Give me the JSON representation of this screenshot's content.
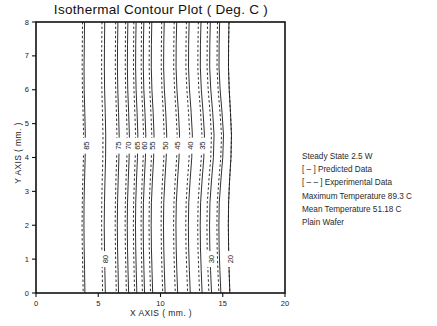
{
  "chart_data": {
    "type": "line",
    "title": "Isothermal Contour Plot  ( Deg. C )",
    "xlabel": "X AXIS ( mm. )",
    "ylabel": "Y AXIS ( mm. )",
    "xlim": [
      0,
      20
    ],
    "ylim": [
      0,
      8
    ],
    "xticks": [
      0,
      5,
      10,
      15,
      20
    ],
    "xticklabels": [
      "0",
      "5",
      "10",
      "15",
      "20"
    ],
    "yticks": [
      0,
      1,
      2,
      3,
      4,
      5,
      6,
      7,
      8
    ],
    "yticklabels": [
      "0",
      "1",
      "2",
      "3",
      "4",
      "5",
      "6",
      "7",
      "8"
    ],
    "grid": false,
    "legend_position": "right-outside",
    "series": [
      {
        "name": "Predicted Data",
        "style": "solid",
        "color": "#1a1a1a"
      },
      {
        "name": "Experimental Data",
        "style": "dashed",
        "color": "#1a1a1a"
      }
    ],
    "contour_levels": [
      85,
      80,
      75,
      70,
      65,
      60,
      55,
      50,
      45,
      40,
      35,
      30,
      25,
      20
    ],
    "contours": [
      {
        "level": 85,
        "label": "85",
        "label_x": 4.0,
        "label_y": 4.35,
        "predicted_x": [
          3.9,
          3.88,
          3.86,
          3.87,
          3.92,
          3.96,
          3.95,
          3.9,
          3.86,
          3.85,
          3.87,
          3.9,
          3.93
        ],
        "experimental_x": [
          3.74,
          3.72,
          3.71,
          3.73,
          3.78,
          3.82,
          3.81,
          3.76,
          3.72,
          3.7,
          3.72,
          3.76,
          3.79
        ]
      },
      {
        "level": 80,
        "label": "80",
        "label_x": 5.55,
        "label_y": 1.0,
        "predicted_x": [
          5.52,
          5.5,
          5.49,
          5.51,
          5.56,
          5.6,
          5.59,
          5.54,
          5.5,
          5.48,
          5.5,
          5.53,
          5.57
        ],
        "experimental_x": [
          5.3,
          5.28,
          5.27,
          5.29,
          5.34,
          5.38,
          5.37,
          5.32,
          5.28,
          5.27,
          5.29,
          5.32,
          5.35
        ]
      },
      {
        "level": 75,
        "label": "75",
        "label_x": 6.62,
        "label_y": 4.35,
        "predicted_x": [
          6.58,
          6.55,
          6.54,
          6.57,
          6.63,
          6.68,
          6.66,
          6.6,
          6.55,
          6.53,
          6.55,
          6.59,
          6.63
        ],
        "experimental_x": [
          6.4,
          6.38,
          6.37,
          6.4,
          6.46,
          6.5,
          6.48,
          6.42,
          6.38,
          6.36,
          6.38,
          6.41,
          6.45
        ]
      },
      {
        "level": 70,
        "label": "70",
        "label_x": 7.42,
        "label_y": 4.35,
        "predicted_x": [
          7.38,
          7.35,
          7.34,
          7.37,
          7.44,
          7.5,
          7.48,
          7.41,
          7.35,
          7.33,
          7.35,
          7.39,
          7.44
        ],
        "experimental_x": [
          7.2,
          7.18,
          7.17,
          7.2,
          7.27,
          7.32,
          7.3,
          7.23,
          7.18,
          7.16,
          7.18,
          7.22,
          7.26
        ]
      },
      {
        "level": 65,
        "label": "65",
        "label_x": 8.08,
        "label_y": 4.35,
        "predicted_x": [
          8.04,
          8.01,
          8.0,
          8.04,
          8.12,
          8.18,
          8.15,
          8.07,
          8.01,
          7.99,
          8.01,
          8.05,
          8.1
        ],
        "experimental_x": [
          7.86,
          7.84,
          7.83,
          7.87,
          7.94,
          8.0,
          7.97,
          7.9,
          7.84,
          7.82,
          7.84,
          7.88,
          7.92
        ]
      },
      {
        "level": 60,
        "label": "60",
        "label_x": 8.7,
        "label_y": 4.35,
        "predicted_x": [
          8.66,
          8.63,
          8.62,
          8.66,
          8.75,
          8.82,
          8.79,
          8.7,
          8.63,
          8.61,
          8.63,
          8.67,
          8.72
        ],
        "experimental_x": [
          8.48,
          8.46,
          8.45,
          8.49,
          8.57,
          8.64,
          8.61,
          8.53,
          8.46,
          8.44,
          8.46,
          8.5,
          8.55
        ]
      },
      {
        "level": 55,
        "label": "55",
        "label_x": 9.35,
        "label_y": 4.35,
        "predicted_x": [
          9.3,
          9.27,
          9.26,
          9.31,
          9.41,
          9.48,
          9.45,
          9.35,
          9.27,
          9.25,
          9.27,
          9.32,
          9.37
        ],
        "experimental_x": [
          9.12,
          9.1,
          9.09,
          9.14,
          9.23,
          9.3,
          9.27,
          9.18,
          9.1,
          9.08,
          9.1,
          9.15,
          9.2
        ]
      },
      {
        "level": 50,
        "label": "50",
        "label_x": 10.35,
        "label_y": 4.35,
        "predicted_x": [
          10.3,
          10.26,
          10.25,
          10.31,
          10.42,
          10.5,
          10.46,
          10.35,
          10.26,
          10.24,
          10.26,
          10.31,
          10.37
        ],
        "experimental_x": [
          10.1,
          10.07,
          10.06,
          10.12,
          10.22,
          10.3,
          10.27,
          10.16,
          10.07,
          10.05,
          10.07,
          10.12,
          10.18
        ]
      },
      {
        "level": 45,
        "label": "45",
        "label_x": 11.35,
        "label_y": 4.35,
        "predicted_x": [
          11.3,
          11.26,
          11.25,
          11.32,
          11.44,
          11.53,
          11.49,
          11.37,
          11.27,
          11.24,
          11.26,
          11.31,
          11.38
        ],
        "experimental_x": [
          11.1,
          11.07,
          11.06,
          11.13,
          11.25,
          11.34,
          11.3,
          11.18,
          11.08,
          11.05,
          11.07,
          11.12,
          11.19
        ]
      },
      {
        "level": 40,
        "label": "40",
        "label_x": 12.35,
        "label_y": 4.35,
        "predicted_x": [
          12.3,
          12.26,
          12.25,
          12.33,
          12.46,
          12.56,
          12.51,
          12.38,
          12.27,
          12.24,
          12.26,
          12.32,
          12.39
        ],
        "experimental_x": [
          12.08,
          12.05,
          12.04,
          12.12,
          12.25,
          12.35,
          12.3,
          12.17,
          12.06,
          12.03,
          12.05,
          12.11,
          12.18
        ]
      },
      {
        "level": 35,
        "label": "35",
        "label_x": 13.3,
        "label_y": 4.35,
        "predicted_x": [
          13.25,
          13.21,
          13.2,
          13.28,
          13.42,
          13.53,
          13.48,
          13.34,
          13.22,
          13.19,
          13.21,
          13.27,
          13.34
        ],
        "experimental_x": [
          13.04,
          13.01,
          13.0,
          13.08,
          13.22,
          13.33,
          13.28,
          13.14,
          13.02,
          12.99,
          13.01,
          13.07,
          13.14
        ]
      },
      {
        "level": 30,
        "label": "30",
        "label_x": 14.05,
        "label_y": 1.0,
        "predicted_x": [
          14.0,
          13.96,
          13.95,
          14.04,
          14.19,
          14.3,
          14.25,
          14.1,
          13.97,
          13.94,
          13.96,
          14.02,
          14.1
        ],
        "experimental_x": [
          13.78,
          13.75,
          13.74,
          13.83,
          13.98,
          14.09,
          14.04,
          13.89,
          13.76,
          13.73,
          13.75,
          13.81,
          13.89
        ]
      },
      {
        "level": 25,
        "label": "",
        "label_x": 14.8,
        "label_y": 4.35,
        "predicted_x": [
          14.75,
          14.71,
          14.7,
          14.79,
          14.94,
          15.06,
          15.0,
          14.85,
          14.72,
          14.69,
          14.71,
          14.77,
          14.85
        ],
        "experimental_x": [
          14.58,
          14.55,
          14.54,
          14.63,
          14.78,
          14.9,
          14.84,
          14.69,
          14.56,
          14.53,
          14.55,
          14.61,
          14.69
        ]
      },
      {
        "level": 20,
        "label": "20",
        "label_x": 15.55,
        "label_y": 1.0,
        "predicted_x": [
          15.5,
          15.47,
          15.46,
          15.52,
          15.62,
          15.7,
          15.66,
          15.55,
          15.47,
          15.45,
          15.47,
          15.51,
          15.57
        ],
        "experimental_x": [
          15.5,
          15.47,
          15.46,
          15.52,
          15.62,
          15.7,
          15.66,
          15.55,
          15.47,
          15.45,
          15.47,
          15.51,
          15.57
        ]
      }
    ],
    "annotations": [
      "Steady State 2.5 W",
      "[ – ] Predicted Data",
      "[ – – ] Experimental Data",
      "Maximum Temperature 89.3 C",
      "Mean Temperature 51.18 C",
      "Plain Wafer"
    ]
  },
  "colors": {
    "axis": "#111111",
    "line": "#1a1a1a",
    "background": "#ffffff",
    "text": "#222222"
  }
}
